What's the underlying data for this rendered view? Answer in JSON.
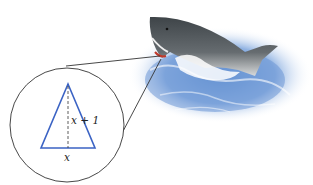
{
  "figure": {
    "triangle": {
      "base_label": "x",
      "height_label": "x + 1"
    },
    "colors": {
      "triangle": "#3b63c4",
      "water": "#7ea6dc",
      "shark_body": "#4a4f52",
      "lines": "#333333"
    }
  }
}
